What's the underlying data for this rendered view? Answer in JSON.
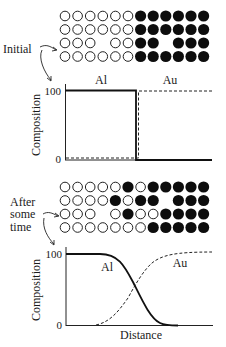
{
  "panels": [
    {
      "stage_label": "Initial",
      "grid": [
        "oooooo******",
        "oooooo******",
        "ooo_oo**_***",
        "oooooo******"
      ],
      "graph": {
        "ylabel": "Composition",
        "ytick_top": "100",
        "ytick_bottom": "0",
        "series_labels": {
          "al": "Al",
          "au": "Au"
        }
      }
    },
    {
      "stage_label": "After some time",
      "stage_label_lines": [
        "After",
        "some",
        "time"
      ],
      "grid": [
        "ooooo*o*****",
        "oooo*o**_***",
        "ooo_o*oo****",
        "ooooooo*****"
      ],
      "graph": {
        "ylabel": "Composition",
        "ytick_top": "100",
        "ytick_bottom": "0",
        "xlabel": "Distance",
        "series_labels": {
          "al": "Al",
          "au": "Au"
        }
      }
    }
  ],
  "chart_data": [
    {
      "type": "line",
      "title": "Initial",
      "xlabel": "",
      "ylabel": "Composition",
      "ylim": [
        0,
        100
      ],
      "x": [
        0,
        0.48,
        0.48,
        1.0
      ],
      "series": [
        {
          "name": "Al",
          "style": "solid",
          "values": [
            100,
            100,
            0,
            0
          ]
        },
        {
          "name": "Au",
          "style": "dashed",
          "values": [
            0,
            0,
            100,
            100
          ]
        }
      ]
    },
    {
      "type": "line",
      "title": "After some time",
      "xlabel": "Distance",
      "ylabel": "Composition",
      "ylim": [
        0,
        100
      ],
      "x": [
        0,
        0.2,
        0.35,
        0.5,
        0.65,
        0.8,
        1.0
      ],
      "series": [
        {
          "name": "Al",
          "style": "solid",
          "values": [
            100,
            100,
            85,
            50,
            15,
            0,
            0
          ]
        },
        {
          "name": "Au",
          "style": "dashed",
          "values": [
            0,
            0,
            15,
            50,
            85,
            100,
            100
          ]
        }
      ]
    }
  ]
}
